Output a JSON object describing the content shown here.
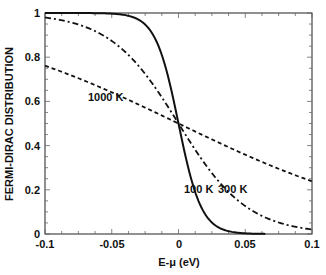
{
  "chart_data": {
    "type": "line",
    "title": "",
    "xlabel": "E-μ (eV)",
    "ylabel": "FERMI-DIRAC DISTRIBUTION",
    "xlim": [
      -0.1,
      0.1
    ],
    "ylim": [
      0,
      1
    ],
    "xticks": [
      "-0.1",
      "-0.05",
      "0",
      "0.05",
      "0.1"
    ],
    "yticks": [
      "0",
      "0.2",
      "0.4",
      "0.6",
      "0.8",
      "1"
    ],
    "grid": false,
    "legend": "none (inline annotations)",
    "x": [
      -0.1,
      -0.09,
      -0.08,
      -0.07,
      -0.06,
      -0.05,
      -0.04,
      -0.03,
      -0.02,
      -0.01,
      0,
      0.01,
      0.02,
      0.03,
      0.04,
      0.05,
      0.06,
      0.07,
      0.08,
      0.09,
      0.1
    ],
    "series": [
      {
        "name": "100 K",
        "style": "solid",
        "values": [
          1.0,
          1.0,
          1.0,
          1.0,
          0.999,
          0.997,
          0.99,
          0.97,
          0.911,
          0.761,
          0.5,
          0.239,
          0.089,
          0.03,
          0.01,
          0.003,
          0.001,
          0.0,
          0.0,
          0.0,
          0.0
        ]
      },
      {
        "name": "300 K",
        "style": "dash-dot",
        "values": [
          0.979,
          0.969,
          0.956,
          0.937,
          0.91,
          0.875,
          0.823,
          0.762,
          0.685,
          0.596,
          0.5,
          0.404,
          0.315,
          0.238,
          0.177,
          0.125,
          0.09,
          0.063,
          0.044,
          0.031,
          0.021
        ]
      },
      {
        "name": "1000 K",
        "style": "dashed",
        "values": [
          0.761,
          0.741,
          0.72,
          0.698,
          0.666,
          0.641,
          0.614,
          0.585,
          0.558,
          0.529,
          0.5,
          0.471,
          0.442,
          0.415,
          0.386,
          0.359,
          0.334,
          0.302,
          0.28,
          0.259,
          0.239
        ]
      }
    ],
    "annotations": [
      {
        "text": "1000 K",
        "x": -0.063,
        "y": 0.6
      },
      {
        "text": "100 K",
        "x": 0.012,
        "y": 0.2
      },
      {
        "text": "300 K",
        "x": 0.043,
        "y": 0.2
      }
    ]
  }
}
